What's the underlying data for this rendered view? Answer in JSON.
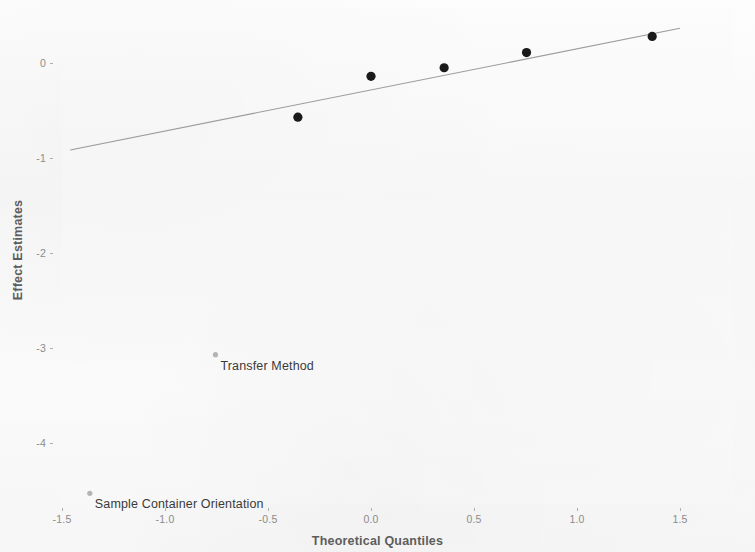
{
  "figure": {
    "background_color": "#fbfbfb",
    "point_color": "#1a1a1a",
    "outlier_point_color": "#b4b4b4",
    "line_color": "#8c8c8c",
    "axis_text_color": "#5d5d5d",
    "tick_text_color": "#8b8b8b"
  },
  "chart_data": {
    "type": "scatter",
    "title": "",
    "subtitle": "",
    "xlabel": "Theoretical Quantiles",
    "ylabel": "Effect Estimates",
    "xlim": [
      -1.62,
      1.62
    ],
    "ylim": [
      -4.55,
      0.45
    ],
    "xticks": [
      -1.5,
      -1.0,
      -0.5,
      0.0,
      0.5,
      1.0,
      1.5
    ],
    "xtick_labels": [
      "-1.5",
      "-1.0",
      "-0.5",
      "0.0",
      "0.5",
      "1.0",
      "1.5"
    ],
    "yticks": [
      0,
      -1,
      -2,
      -3,
      -4
    ],
    "ytick_labels": [
      "0",
      "-1",
      "-2",
      "-3",
      "-4"
    ],
    "grid": false,
    "legend": "none",
    "x": [
      -1.365,
      -0.755,
      -0.355,
      0.0,
      0.355,
      0.755,
      1.365
    ],
    "y": [
      -4.53,
      -3.07,
      -0.57,
      -0.14,
      -0.05,
      0.11,
      0.28
    ],
    "points": [
      {
        "x": -1.365,
        "y": -4.53,
        "style": "outlier",
        "label": "Sample Container Orientation"
      },
      {
        "x": -0.755,
        "y": -3.07,
        "style": "outlier",
        "label": "Transfer Method"
      },
      {
        "x": -0.355,
        "y": -0.57,
        "style": "normal",
        "label": ""
      },
      {
        "x": 0.0,
        "y": -0.14,
        "style": "normal",
        "label": ""
      },
      {
        "x": 0.355,
        "y": -0.05,
        "style": "normal",
        "label": ""
      },
      {
        "x": 0.755,
        "y": 0.11,
        "style": "normal",
        "label": ""
      },
      {
        "x": 1.365,
        "y": 0.28,
        "style": "normal",
        "label": ""
      }
    ],
    "reference_line": {
      "description": "fitted normal reference line",
      "x_start": -1.46,
      "y_start": -0.915,
      "x_end": 1.5,
      "y_end": 0.365,
      "color": "#8c8c8c"
    },
    "annotations": [
      {
        "text": "Transfer Method",
        "x": -0.755,
        "y": -3.07
      },
      {
        "text": "Sample Container Orientation",
        "x": -1.365,
        "y": -4.53
      }
    ]
  }
}
